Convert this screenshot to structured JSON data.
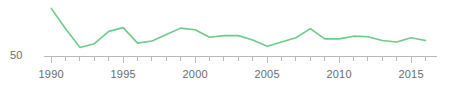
{
  "chart_data": {
    "type": "line",
    "title": "",
    "subtitle": "",
    "xlabel": "",
    "ylabel": "",
    "grid": false,
    "legend": false,
    "legend_position": "none",
    "line_color": "#6fcb89",
    "axis_color": "#b9b9b9",
    "text_color": "#6b6b6b",
    "background": "#ffffff",
    "x": [
      1990,
      1991,
      1992,
      1993,
      1994,
      1995,
      1996,
      1997,
      1998,
      1999,
      2000,
      2001,
      2002,
      2003,
      2004,
      2005,
      2006,
      2007,
      2008,
      2009,
      2010,
      2011,
      2012,
      2013,
      2014,
      2015,
      2016
    ],
    "values": [
      95.0,
      76.0,
      58.5,
      62.0,
      73.5,
      77.0,
      62.5,
      64.5,
      70.5,
      76.5,
      75.0,
      68.0,
      69.5,
      69.5,
      65.5,
      59.5,
      63.5,
      67.5,
      76.0,
      66.5,
      66.5,
      69.0,
      68.5,
      65.0,
      63.5,
      67.5,
      65.0
    ],
    "ylim": [
      50,
      100
    ],
    "xlim": [
      1989.5,
      2016.8
    ],
    "y_ticks": [
      50
    ],
    "y_tick_labels": [
      "50"
    ],
    "x_ticks": [
      1990,
      1991,
      1992,
      1993,
      1994,
      1995,
      1996,
      1997,
      1998,
      1999,
      2000,
      2001,
      2002,
      2003,
      2004,
      2005,
      2006,
      2007,
      2008,
      2009,
      2010,
      2011,
      2012,
      2013,
      2014,
      2015,
      2016
    ],
    "x_major_ticks": [
      1990,
      1995,
      2000,
      2005,
      2010,
      2015
    ],
    "x_tick_labels": [
      "1990",
      "1995",
      "2000",
      "2005",
      "2010",
      "2015"
    ],
    "annotations": []
  },
  "axis": {
    "y_label_50": "50"
  }
}
